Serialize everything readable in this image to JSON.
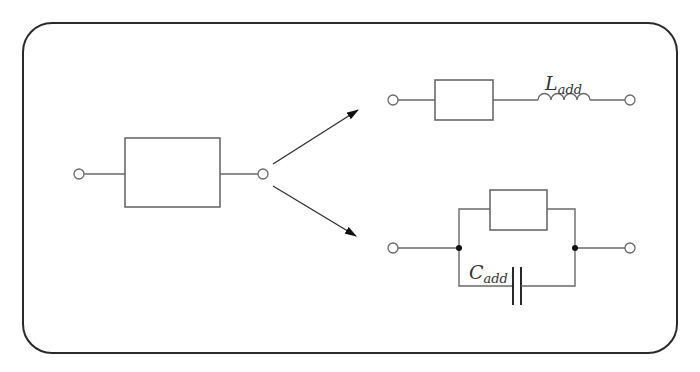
{
  "diagram": {
    "type": "circuit-equivalence",
    "frame": {
      "border_color": "#2a2a2a",
      "corner_radius": 30
    },
    "colors": {
      "wire": "#6a6a6a",
      "node": "#111111",
      "arrow": "#333333",
      "label": "#333333"
    },
    "left_circuit": {
      "components": [
        "terminal",
        "impedance-box",
        "terminal"
      ]
    },
    "upper_branch": {
      "components": [
        "terminal",
        "impedance-box",
        "inductor",
        "terminal"
      ],
      "inductor_label": {
        "main": "L",
        "sub": "add"
      }
    },
    "lower_branch": {
      "components": [
        "terminal",
        "node",
        "impedance-box (parallel)",
        "capacitor (parallel)",
        "node",
        "terminal"
      ],
      "capacitor_label": {
        "main": "C",
        "sub": "add"
      }
    },
    "arrows": [
      {
        "from": "left_circuit",
        "to": "upper_branch"
      },
      {
        "from": "left_circuit",
        "to": "lower_branch"
      }
    ]
  }
}
